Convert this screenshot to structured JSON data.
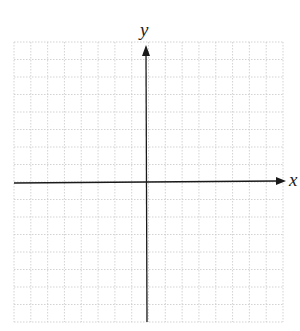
{
  "diagram": {
    "type": "coordinate-grid",
    "x_axis_label": "x",
    "y_axis_label": "y",
    "grid": {
      "columns": 16,
      "rows": 16,
      "style": "dotted"
    },
    "colors": {
      "axis": "#1a1a1a",
      "grid": "#c8c8c8",
      "background": "#ffffff"
    }
  }
}
